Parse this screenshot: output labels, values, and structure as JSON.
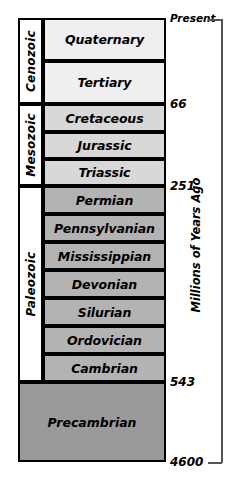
{
  "chart_data": {
    "type": "table",
    "axis_title": "Millions of Years Ago",
    "axis_unit": "Ma",
    "orientation": "vertical-descending",
    "age_ticks": [
      {
        "label": "Present",
        "value": 0,
        "y": 19
      },
      {
        "label": "66",
        "value": 66,
        "y": 104
      },
      {
        "label": "251",
        "value": 251,
        "y": 186
      },
      {
        "label": "543",
        "value": 543,
        "y": 382
      },
      {
        "label": "4600",
        "value": 4600,
        "y": 462
      }
    ],
    "eras": [
      {
        "name": "Cenozoic",
        "start_ma": 66,
        "end_ma": 0,
        "top": 18,
        "height": 86,
        "fill": "#f0f0f0",
        "periods": [
          {
            "name": "Quaternary",
            "top": 18,
            "height": 43,
            "fill": "#efefef"
          },
          {
            "name": "Tertiary",
            "top": 61,
            "height": 43,
            "fill": "#efefef"
          }
        ]
      },
      {
        "name": "Mesozoic",
        "start_ma": 251,
        "end_ma": 66,
        "top": 104,
        "height": 82,
        "fill": "#dcdcdc",
        "periods": [
          {
            "name": "Cretaceous",
            "top": 104,
            "height": 28,
            "fill": "#d8d8d8"
          },
          {
            "name": "Jurassic",
            "top": 132,
            "height": 27,
            "fill": "#d8d8d8"
          },
          {
            "name": "Triassic",
            "top": 159,
            "height": 27,
            "fill": "#d8d8d8"
          }
        ]
      },
      {
        "name": "Paleozoic",
        "start_ma": 543,
        "end_ma": 251,
        "top": 186,
        "height": 196,
        "fill": "#b5b5b5",
        "periods": [
          {
            "name": "Permian",
            "top": 186,
            "height": 28,
            "fill": "#b3b3b3"
          },
          {
            "name": "Pennsylvanian",
            "top": 214,
            "height": 28,
            "fill": "#b3b3b3"
          },
          {
            "name": "Mississippian",
            "top": 242,
            "height": 28,
            "fill": "#b3b3b3"
          },
          {
            "name": "Devonian",
            "top": 270,
            "height": 28,
            "fill": "#b3b3b3"
          },
          {
            "name": "Silurian",
            "top": 298,
            "height": 28,
            "fill": "#b3b3b3"
          },
          {
            "name": "Ordovician",
            "top": 326,
            "height": 28,
            "fill": "#b3b3b3"
          },
          {
            "name": "Cambrian",
            "top": 354,
            "height": 28,
            "fill": "#b3b3b3"
          }
        ]
      }
    ],
    "precambrian": {
      "name": "Precambrian",
      "start_ma": 4600,
      "end_ma": 543,
      "top": 382,
      "height": 80,
      "fill": "#9a9a9a"
    },
    "colors": {
      "outline": "#000000",
      "bracket": "#555555",
      "background": "#ffffff",
      "cenozoic_fill": "#efefef",
      "mesozoic_fill": "#d8d8d8",
      "paleozoic_fill": "#b3b3b3",
      "precambrian_fill": "#9a9a9a"
    }
  }
}
